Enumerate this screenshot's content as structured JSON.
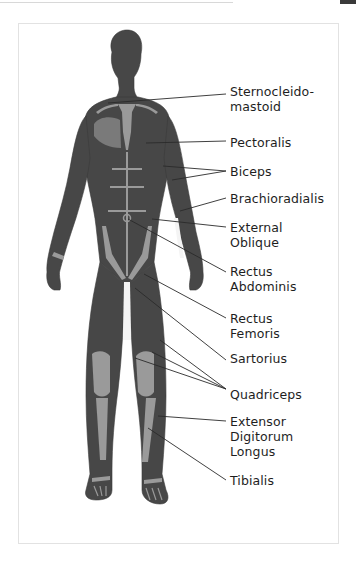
{
  "diagram": {
    "colors": {
      "muscle": "#4a4a4a",
      "muscle_dark": "#3a3a3a",
      "tendon": "#9c9c9c",
      "leader_line": "#2a2a2a",
      "panel_border": "#e2e2e2"
    },
    "labels": [
      {
        "id": "sternocleidomastoid",
        "text": "Sternocleido-\nmastoid",
        "x": 230,
        "y": 84,
        "line": [
          [
            108,
            103
          ],
          [
            226,
            94
          ]
        ]
      },
      {
        "id": "pectoralis",
        "text": "Pectoralis",
        "x": 230,
        "y": 135,
        "line": [
          [
            146,
            143
          ],
          [
            226,
            141
          ]
        ]
      },
      {
        "id": "biceps",
        "text": "Biceps",
        "x": 230,
        "y": 164,
        "line": [
          [
            163,
            166
          ],
          [
            226,
            171
          ]
        ],
        "line2": [
          [
            172,
            180
          ],
          [
            226,
            171
          ]
        ]
      },
      {
        "id": "brachioradialis",
        "text": "Brachioradialis",
        "x": 230,
        "y": 191,
        "line": [
          [
            180,
            211
          ],
          [
            226,
            198
          ]
        ]
      },
      {
        "id": "external_oblique",
        "text": "External\nOblique",
        "x": 230,
        "y": 220,
        "line": [
          [
            152,
            219
          ],
          [
            226,
            227
          ]
        ]
      },
      {
        "id": "rectus_abdominis",
        "text": "Rectus\nAbdominis",
        "x": 230,
        "y": 264,
        "line": [
          [
            128,
            219
          ],
          [
            226,
            272
          ]
        ]
      },
      {
        "id": "rectus_femoris",
        "text": "Rectus\nFemoris",
        "x": 230,
        "y": 311,
        "line": [
          [
            144,
            274
          ],
          [
            226,
            318
          ]
        ]
      },
      {
        "id": "sartorius",
        "text": "Sartorius",
        "x": 230,
        "y": 351,
        "line": [
          [
            135,
            288
          ],
          [
            226,
            360
          ]
        ]
      },
      {
        "id": "quadriceps",
        "text": "Quadriceps",
        "x": 230,
        "y": 387,
        "line": [
          [
            160,
            340
          ],
          [
            226,
            389
          ]
        ],
        "line2": [
          [
            152,
            352
          ],
          [
            226,
            389
          ]
        ],
        "line3": [
          [
            135,
            358
          ],
          [
            226,
            389
          ]
        ]
      },
      {
        "id": "extensor_digitorum_longus",
        "text": "Extensor\nDigitorum\nLongus",
        "x": 230,
        "y": 414,
        "line": [
          [
            158,
            416
          ],
          [
            226,
            421
          ]
        ]
      },
      {
        "id": "tibialis",
        "text": "Tibialis",
        "x": 230,
        "y": 473,
        "line": [
          [
            148,
            428
          ],
          [
            226,
            480
          ]
        ]
      }
    ]
  }
}
